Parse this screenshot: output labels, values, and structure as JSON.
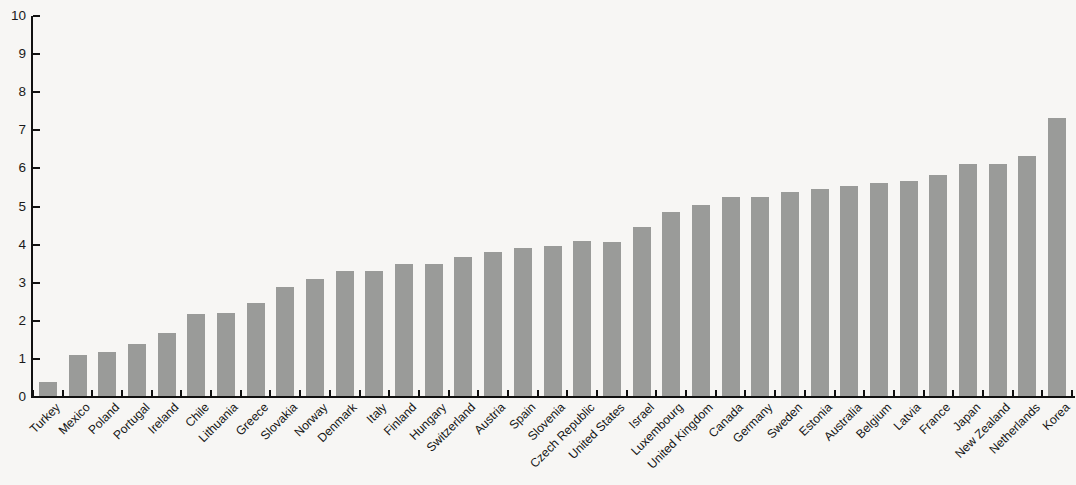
{
  "chart_data": {
    "type": "bar",
    "title": "",
    "subtitle": "",
    "xlabel": "",
    "ylabel": "",
    "ylim": [
      0,
      10
    ],
    "y_ticks": [
      0,
      1,
      2,
      3,
      4,
      5,
      6,
      7,
      8,
      9,
      10
    ],
    "grid": false,
    "legend": null,
    "bar_color": "#9a9b99",
    "background_color": "#f7f6f4",
    "axis_color": "#111111",
    "categories": [
      "Turkey",
      "Mexico",
      "Poland",
      "Portugal",
      "Ireland",
      "Chile",
      "Lithuania",
      "Greece",
      "Slovakia",
      "Norway",
      "Denmark",
      "Italy",
      "Finland",
      "Hungary",
      "Switzerland",
      "Austria",
      "Spain",
      "Slovenia",
      "Czech Republic",
      "United States",
      "Israel",
      "Luxembourg",
      "United Kingdom",
      "Canada",
      "Germany",
      "Sweden",
      "Estonia",
      "Australia",
      "Belgium",
      "Latvia",
      "France",
      "Japan",
      "New Zealand",
      "Netherlands",
      "Korea"
    ],
    "values": [
      0.4,
      1.1,
      1.18,
      1.38,
      1.68,
      2.18,
      2.2,
      2.48,
      2.88,
      3.1,
      3.3,
      3.3,
      3.48,
      3.48,
      3.67,
      3.8,
      3.92,
      3.97,
      4.1,
      4.08,
      4.45,
      4.85,
      5.05,
      5.26,
      5.26,
      5.37,
      5.45,
      5.55,
      5.63,
      5.66,
      5.82,
      6.12,
      6.12,
      6.32,
      7.32
    ]
  }
}
